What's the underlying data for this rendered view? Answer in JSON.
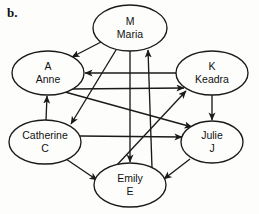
{
  "figure": {
    "panel_label": "b.",
    "type": "directed-graph"
  },
  "nodes": [
    {
      "id": "M",
      "line1": "M",
      "line2": "Maria",
      "cx": 130,
      "cy": 28,
      "rx": 37,
      "ry": 23
    },
    {
      "id": "A",
      "line1": "A",
      "line2": "Anne",
      "cx": 48,
      "cy": 73,
      "rx": 36,
      "ry": 22
    },
    {
      "id": "K",
      "line1": "K",
      "line2": "Keadra",
      "cx": 212,
      "cy": 73,
      "rx": 36,
      "ry": 22
    },
    {
      "id": "C",
      "line1": "Catherine",
      "line2": "C",
      "cx": 45,
      "cy": 142,
      "rx": 36,
      "ry": 22
    },
    {
      "id": "J",
      "line1": "Julie",
      "line2": "J",
      "cx": 212,
      "cy": 142,
      "rx": 31,
      "ry": 21
    },
    {
      "id": "E",
      "line1": "Emily",
      "line2": "E",
      "cx": 130,
      "cy": 185,
      "rx": 36,
      "ry": 22
    }
  ],
  "edges": [
    {
      "id": "M-A",
      "from": "M",
      "to": "A",
      "x1": 101,
      "y1": 42,
      "x2": 72,
      "y2": 57
    },
    {
      "id": "M-C",
      "from": "M",
      "to": "C",
      "x1": 116,
      "y1": 50,
      "x2": 71,
      "y2": 124
    },
    {
      "id": "M-E",
      "from": "M",
      "to": "E",
      "x1": 130,
      "y1": 51,
      "x2": 130,
      "y2": 162
    },
    {
      "id": "K-A",
      "from": "K",
      "to": "A",
      "x1": 176,
      "y1": 73,
      "x2": 85,
      "y2": 73
    },
    {
      "id": "K-J",
      "from": "K",
      "to": "J",
      "x1": 212,
      "y1": 95,
      "x2": 212,
      "y2": 120
    },
    {
      "id": "C-A",
      "from": "C",
      "to": "A",
      "x1": 46,
      "y1": 120,
      "x2": 47,
      "y2": 96
    },
    {
      "id": "C-E",
      "from": "C",
      "to": "E",
      "x1": 66,
      "y1": 159,
      "x2": 97,
      "y2": 180
    },
    {
      "id": "C-J",
      "from": "C",
      "to": "J",
      "x1": 80,
      "y1": 136,
      "x2": 182,
      "y2": 137
    },
    {
      "id": "A-K",
      "from": "A",
      "to": "K",
      "x1": 70,
      "y1": 89,
      "x2": 184,
      "y2": 88
    },
    {
      "id": "A-J",
      "from": "A",
      "to": "J",
      "x1": 65,
      "y1": 92,
      "x2": 192,
      "y2": 127
    },
    {
      "id": "J-E",
      "from": "J",
      "to": "E",
      "x1": 190,
      "y1": 159,
      "x2": 164,
      "y2": 179
    },
    {
      "id": "E-M",
      "from": "E",
      "to": "M",
      "x1": 152,
      "y1": 168,
      "x2": 148,
      "y2": 50
    },
    {
      "id": "E-K",
      "from": "E",
      "to": "K",
      "x1": 116,
      "y1": 166,
      "x2": 186,
      "y2": 91
    }
  ],
  "style": {
    "stroke_color": "#1a1a1a",
    "node_fill": "#fdfdfb",
    "background": "#fdfdfb"
  }
}
